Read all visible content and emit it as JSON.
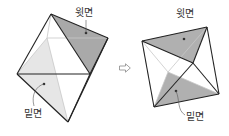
{
  "figure_left": {
    "top_label": "윗면",
    "bottom_label": "밑면",
    "vertices": {
      "apex": [
        51,
        14
      ],
      "right": [
        108,
        38
      ],
      "left": [
        17,
        74
      ],
      "front_right": [
        90,
        74
      ],
      "bottom": [
        68,
        122
      ],
      "back": [
        47,
        38
      ]
    },
    "top_face_color": "#a9a9a9",
    "bottom_face_color": "#e6e6e6"
  },
  "figure_right": {
    "top_label": "윗면",
    "bottom_label": "밑면",
    "vertices": {
      "top_right": [
        207,
        27
      ],
      "left": [
        142,
        41
      ],
      "bottom_left": [
        154,
        107
      ],
      "bottom_right": [
        219,
        94
      ],
      "center": [
        193,
        63
      ],
      "back_center": [
        168,
        72
      ]
    },
    "top_face_color": "#b0b0b0",
    "bottom_face_color": "#b0b0b0"
  },
  "arrow": {
    "glyph": "⇨",
    "meaning": "transforms-to"
  },
  "colors": {
    "edge": "#222222",
    "hidden_edge": "#c8c8c8",
    "label_text": "#333333"
  }
}
